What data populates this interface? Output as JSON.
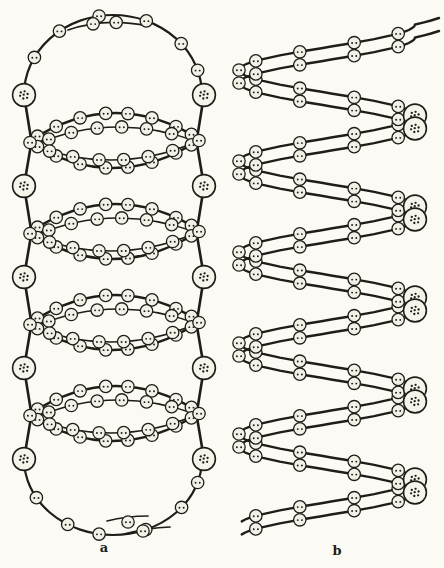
{
  "figure": {
    "labels": {
      "a": "a",
      "b": "b"
    },
    "colors": {
      "ink": "#201d18",
      "paper": "#fbfaf5",
      "bead_fill": "#f3f0e8",
      "large_fill": "#f6f3eb"
    },
    "strokes": {
      "outer_arc": 2.6,
      "inner_arc": 1.5,
      "cap": 2.2,
      "connector": 2.6,
      "strand": 2.4,
      "bead_outline": 1.3,
      "large_outline": 1.6
    },
    "beads": {
      "small_r": 6.2,
      "large_r": 11.4,
      "dot_r": 0.95,
      "large_dot_r": 1.15,
      "small_dots": [
        [
          -2.1,
          0.3
        ],
        [
          2.1,
          0.3
        ]
      ],
      "large_dots": [
        [
          -3.2,
          -2.6
        ],
        [
          0.6,
          -3.7
        ],
        [
          3.6,
          -1.0
        ],
        [
          -3.9,
          0.8
        ],
        [
          -0.7,
          3.5
        ],
        [
          3.1,
          2.8
        ],
        [
          -0.3,
          -0.3
        ]
      ]
    },
    "panel_a": {
      "cx": 113,
      "row_y0": 95,
      "pitch": 91,
      "rows": 5,
      "large_x_left": 24,
      "large_x_right": 204,
      "tip_x_left": 31,
      "tip_x_right": 197,
      "cap_rx": 89,
      "cap_ry_top": 80,
      "cap_ry_bottom": 76,
      "cap_top_bead_angles": [
        152,
        127,
        99,
        68,
        40,
        18
      ],
      "cap_bottom_bead_ts": [
        0.17,
        0.33,
        0.45,
        0.62,
        0.78,
        0.9
      ],
      "tail_top": {
        "p0": [
          68,
          30
        ],
        "pc": [
          105,
          17
        ],
        "p1": [
          148,
          26
        ],
        "bead_ts": [
          0.33,
          0.62
        ]
      },
      "tail_bottom": {
        "lines": [
          [
            [
              107,
              521
            ],
            [
              127,
              516
            ],
            [
              148,
              516
            ]
          ],
          [
            [
              124,
              534
            ],
            [
              147,
              528
            ],
            [
              170,
              527
            ]
          ]
        ],
        "beads": [
          [
            128,
            522
          ],
          [
            143,
            531
          ]
        ]
      },
      "eye_cy0": 140.5,
      "eye_count": 4,
      "eye_outer_bead_ts": [
        0.05,
        0.16,
        0.3,
        0.45,
        0.58,
        0.72,
        0.86,
        0.95
      ],
      "eye_inner_bead_ts": [
        0.1,
        0.24,
        0.4,
        0.55,
        0.7,
        0.85
      ]
    },
    "panel_b": {
      "cx": 327,
      "amplitude": 88,
      "y_phase0": 24.5,
      "pitch": 91,
      "strand_dy": 13,
      "phase_end": 5.47,
      "bead_phase_step": 0.1,
      "large_phases": [
        1,
        2,
        3,
        4,
        5
      ],
      "top_flick": [
        [
          439,
          18
        ],
        [
          431,
          20.5
        ],
        [
          424,
          22.3
        ]
      ]
    }
  }
}
